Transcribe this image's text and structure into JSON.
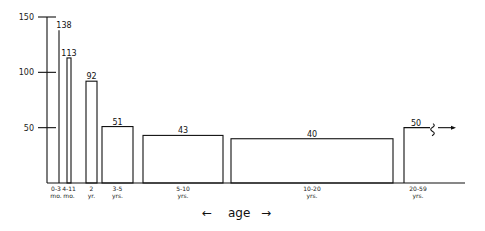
{
  "chart_data": {
    "type": "bar",
    "title": "",
    "xlabel": "age",
    "ylabel": "",
    "ylim": [
      0,
      150
    ],
    "yticks": [
      50,
      100,
      150
    ],
    "grid": false,
    "legend": null,
    "categories": [
      "0-3 mo.",
      "4-11 mo.",
      "2 yr.",
      "3-5 yrs.",
      "5-10 yrs.",
      "10-20 yrs.",
      "20-59 yrs."
    ],
    "category_lines": [
      [
        "0-3",
        "mo."
      ],
      [
        "4-11",
        "mo."
      ],
      [
        "2",
        "yr."
      ],
      [
        "3-5",
        "yrs."
      ],
      [
        "5-10",
        "yrs."
      ],
      [
        "10-20",
        "yrs."
      ],
      [
        "20-59",
        "yrs."
      ]
    ],
    "values": [
      138,
      113,
      92,
      51,
      43,
      40,
      50
    ],
    "value_labels": [
      "138",
      "113",
      "92",
      "51",
      "43",
      "40",
      "50"
    ],
    "annotations": [
      "bar widths proportional to age span",
      "20-59 yrs bar continues (break mark with arrow)"
    ],
    "xlabel_arrows": [
      "←",
      "→"
    ]
  }
}
